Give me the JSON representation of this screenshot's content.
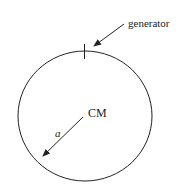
{
  "diagram": {
    "labels": {
      "generator": "generator",
      "center": "CM",
      "radius": "a"
    },
    "circle": {
      "cx": 85,
      "cy": 116,
      "rx": 67,
      "ry": 65
    },
    "colors": {
      "stroke": "#222222",
      "background": "#ffffff"
    }
  }
}
